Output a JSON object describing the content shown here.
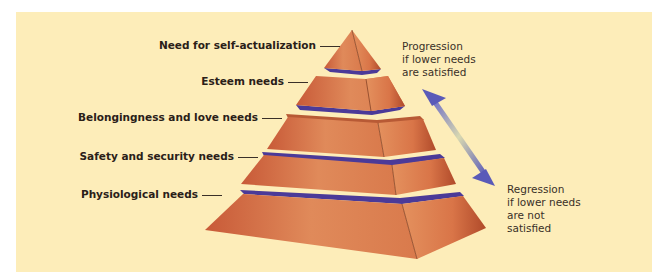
{
  "diagram": {
    "type": "pyramid",
    "colors": {
      "background": "#fdedb9",
      "tier_fill": "#d9754a",
      "tier_shade": "#b85a35",
      "slab": "#4b3a98",
      "arrow": "#5a5ab8"
    },
    "levels": [
      {
        "label": "Need for self-actualization"
      },
      {
        "label": "Esteem needs"
      },
      {
        "label": "Belongingness and love needs"
      },
      {
        "label": "Safety and security needs"
      },
      {
        "label": "Physiological needs"
      }
    ],
    "progression_note": {
      "lines": [
        "Progression",
        "if lower needs",
        "are satisfied"
      ]
    },
    "regression_note": {
      "lines": [
        "Regression",
        "if lower needs",
        "are not",
        "satisfied"
      ]
    }
  }
}
